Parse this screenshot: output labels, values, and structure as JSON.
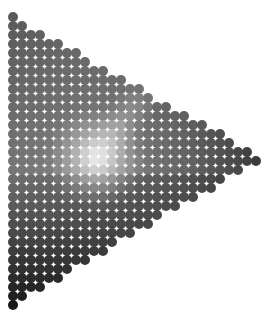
{
  "figure": {
    "shape": "right-pointing triangle of circles",
    "vertices": {
      "top_left": [
        13,
        17
      ],
      "tip_right": [
        262,
        158
      ],
      "bottom_left": [
        13,
        305
      ]
    },
    "grid": {
      "pitch_px": 9,
      "circle_diameter_px": 10
    },
    "shading": {
      "base_colors": {
        "top_left": "#5a5a5a",
        "upper_mid": "#8a8a8a",
        "left_mid": "#6e6e6e",
        "right_tip": "#2a2a2a",
        "bottom": "#1a1a1a"
      },
      "highlight": {
        "center": [
          97,
          157
        ],
        "color": "#f2f2f2",
        "radius_px": 55
      },
      "streak": {
        "from": [
          97,
          157
        ],
        "to": [
          135,
          105
        ],
        "color": "#c8c8c8"
      }
    }
  }
}
